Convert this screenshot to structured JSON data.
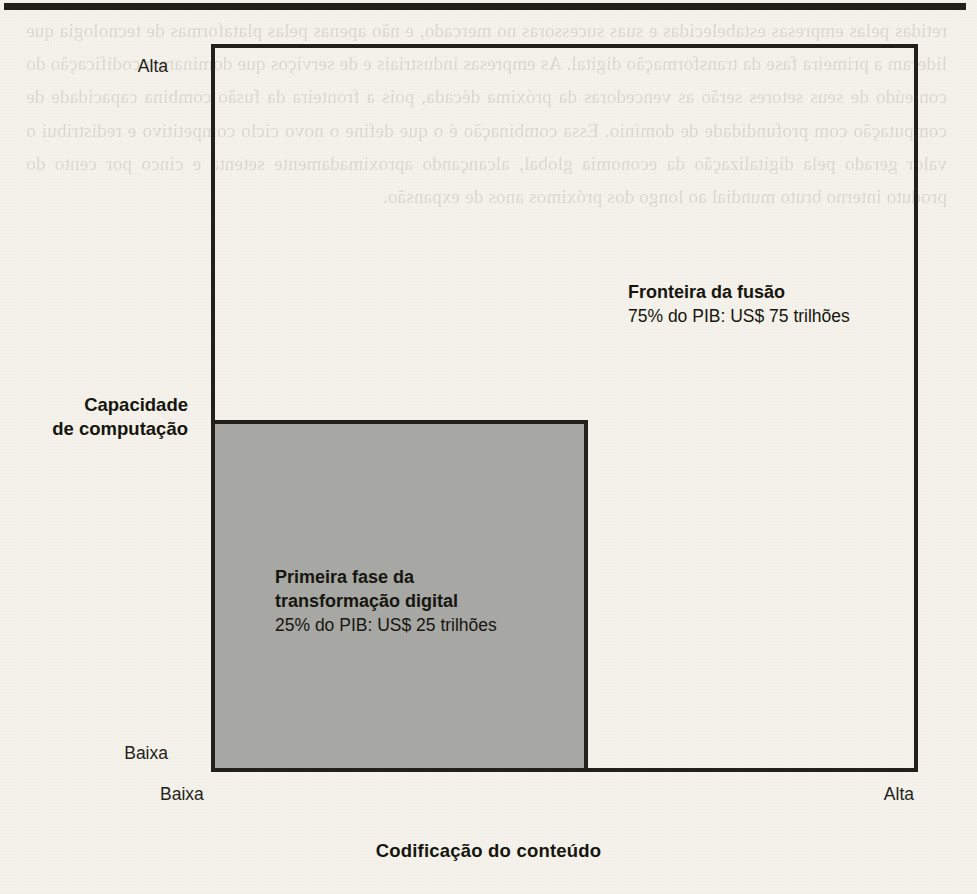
{
  "figure": {
    "type": "2x2-matrix-diagram",
    "background_color": "#f4f2ea",
    "line_color": "#20201c",
    "fill_color": "#a7a7a3"
  },
  "axes": {
    "y": {
      "title_line1": "Capacidade",
      "title_line2": "de computação",
      "tick_high": "Alta",
      "tick_low": "Baixa"
    },
    "x": {
      "title": "Codificação do conteúdo",
      "tick_low": "Baixa",
      "tick_high": "Alta"
    }
  },
  "annotations": [
    {
      "id": "frontier",
      "title": "Fronteira da fusão",
      "subtitle": "75% do PIB: US$ 75 trilhões"
    },
    {
      "id": "first-phase",
      "title": "Primeira fase da\ntransformação digital",
      "subtitle": "25% do PIB: US$ 25 trilhões"
    }
  ],
  "chart_data": {
    "type": "bar",
    "title": "",
    "xlabel": "Codificação do conteúdo",
    "ylabel": "Capacidade de computação",
    "categories": [
      "Primeira fase da transformação digital",
      "Fronteira da fusão"
    ],
    "values": [
      25,
      75
    ],
    "value_unit": "% do PIB",
    "value_labels": [
      "25% do PIB: US$ 25 trilhões",
      "75% do PIB: US$ 75 trilhões"
    ],
    "absolute_values_usd_trillions": [
      25,
      75
    ],
    "xlim_labels": [
      "Baixa",
      "Alta"
    ],
    "ylim_labels": [
      "Baixa",
      "Alta"
    ],
    "grid": false,
    "legend": "none",
    "regions": [
      {
        "name": "Primeira fase da transformação digital",
        "x_range": [
          "Baixa",
          "média"
        ],
        "y_range": [
          "Baixa",
          "média"
        ],
        "share_of_gdp_percent": 25,
        "value_usd_trillions": 75,
        "fill": "#a7a7a3"
      },
      {
        "name": "Fronteira da fusão",
        "x_range": [
          "Baixa",
          "Alta"
        ],
        "y_range": [
          "Baixa",
          "Alta"
        ],
        "share_of_gdp_percent": 75,
        "value_usd_trillions": 75,
        "fill": "none"
      }
    ]
  },
  "showthrough_text": "retidas pelas empresas estabelecidas e suas sucessoras no mercado, e não apenas pelas plataformas de tecnologia que lideram a primeira fase da transformação digital. As empresas industriais e de serviços que dominam a codificação do conteúdo de seus setores serão as vencedoras da próxima década, pois a fronteira da fusão combina capacidade de computação com profundidade de domínio. Essa combinação é o que define o novo ciclo competitivo e redistribui o valor gerado pela digitalização da economia global, alcançando aproximadamente setenta e cinco por cento do produto interno bruto mundial ao longo dos próximos anos de expansão."
}
